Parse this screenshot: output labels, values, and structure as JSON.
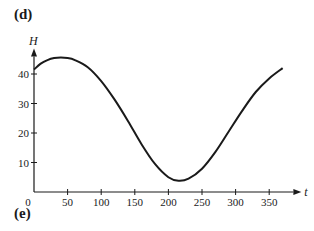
{
  "panel_labels": {
    "top": "(d)",
    "bottom": "(e)"
  },
  "chart_data": {
    "type": "line",
    "title": "",
    "xlabel": "t",
    "ylabel": "H",
    "xlim": [
      0,
      380
    ],
    "ylim": [
      0,
      50
    ],
    "xticks": [
      50,
      100,
      150,
      200,
      250,
      300,
      350
    ],
    "yticks": [
      10,
      20,
      30,
      40
    ],
    "origin_label": "0",
    "grid": false,
    "series": [
      {
        "name": "H(t)",
        "x": [
          0,
          10,
          20,
          30,
          40,
          50,
          60,
          80,
          100,
          120,
          140,
          160,
          180,
          200,
          215,
          230,
          250,
          270,
          290,
          310,
          330,
          350,
          370
        ],
        "values": [
          41.5,
          43.5,
          44.7,
          45.4,
          45.6,
          45.4,
          44.8,
          42.3,
          37.6,
          31.3,
          24.0,
          16.2,
          9.5,
          5.0,
          3.8,
          4.5,
          7.9,
          13.6,
          20.6,
          27.6,
          33.9,
          38.5,
          42.0
        ]
      }
    ]
  }
}
